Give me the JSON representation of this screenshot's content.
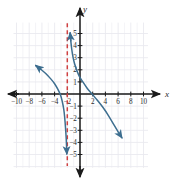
{
  "chart_data": {
    "type": "line",
    "title": "",
    "xlabel": "x",
    "ylabel": "y",
    "xlim": [
      -11.5,
      11.5
    ],
    "ylim": [
      -6.2,
      6.2
    ],
    "grid": true,
    "legend": "none",
    "x_ticks": [
      -10,
      -8,
      -6,
      -4,
      -2,
      2,
      4,
      6,
      8,
      10
    ],
    "x_tick_labels": [
      "-10",
      "-8",
      "-6",
      "-4",
      "-2",
      "2",
      "4",
      "6",
      "8",
      "10"
    ],
    "y_ticks": [
      5,
      4,
      3,
      2,
      1,
      -1,
      -2,
      -3,
      -4,
      -5
    ],
    "y_tick_labels": [
      "5",
      "4",
      "3",
      "2",
      "1",
      "-1",
      "-2",
      "-3",
      "-4",
      "-5"
    ],
    "curve_color": "#3d6e8f",
    "asymptote_color": "#cf4040",
    "grid_color": "#e8e8ee",
    "axis_color": "#1a1a1a",
    "annotations": [
      {
        "name": "vertical-asymptote",
        "type": "vline",
        "x": -2,
        "style": "dashed",
        "color": "#cf4040"
      }
    ],
    "series": [
      {
        "name": "left-branch",
        "arrow_start": true,
        "arrow_end": true,
        "points": [
          [
            -6.95,
            2.35
          ],
          [
            -6.2,
            2.05
          ],
          [
            -5.4,
            1.7
          ],
          [
            -4.6,
            1.25
          ],
          [
            -4.0,
            0.85
          ],
          [
            -3.5,
            0.4
          ],
          [
            -3.1,
            -0.05
          ],
          [
            -2.8,
            -0.6
          ],
          [
            -2.55,
            -1.3
          ],
          [
            -2.4,
            -2.0
          ],
          [
            -2.28,
            -2.8
          ],
          [
            -2.18,
            -3.6
          ],
          [
            -2.12,
            -4.3
          ],
          [
            -2.08,
            -4.95
          ]
        ]
      },
      {
        "name": "right-branch",
        "arrow_start": true,
        "arrow_end": true,
        "points": [
          [
            -1.55,
            5.05
          ],
          [
            -1.45,
            4.4
          ],
          [
            -1.3,
            3.7
          ],
          [
            -1.1,
            3.05
          ],
          [
            -0.85,
            2.5
          ],
          [
            -0.5,
            1.95
          ],
          [
            -0.1,
            1.45
          ],
          [
            0.45,
            1.0
          ],
          [
            1.1,
            0.5
          ],
          [
            1.9,
            0.0
          ],
          [
            2.7,
            -0.5
          ],
          [
            3.6,
            -1.1
          ],
          [
            4.5,
            -1.8
          ],
          [
            5.4,
            -2.6
          ],
          [
            6.2,
            -3.3
          ],
          [
            6.6,
            -3.62
          ]
        ]
      }
    ]
  },
  "axes": {
    "x_axis_name": "x",
    "y_axis_name": "y"
  }
}
